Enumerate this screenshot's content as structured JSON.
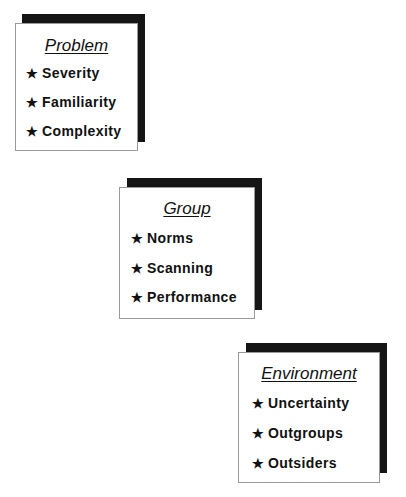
{
  "boxes": [
    {
      "title": "Problem",
      "items": [
        "Severity",
        "Familiarity",
        "Complexity"
      ]
    },
    {
      "title": "Group",
      "items": [
        "Norms",
        "Scanning",
        "Performance"
      ]
    },
    {
      "title": "Environment",
      "items": [
        "Uncertainty",
        "Outgroups",
        "Outsiders"
      ]
    }
  ],
  "bullet_icon": "★",
  "colors": {
    "shadow": "#151515",
    "card": "#ffffff",
    "text": "#111111"
  }
}
